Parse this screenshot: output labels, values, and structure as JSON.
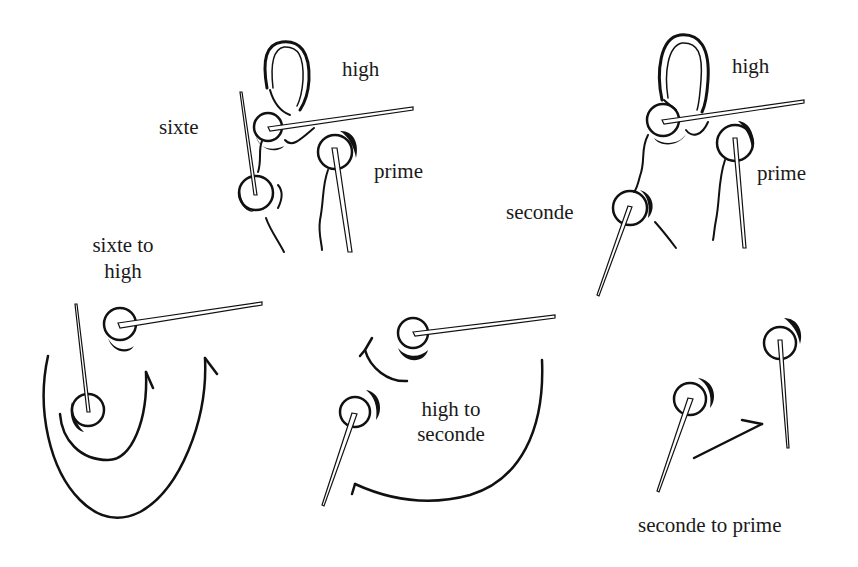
{
  "figure": {
    "colors": {
      "ink": "#111111",
      "background": "#ffffff"
    }
  },
  "panels": {
    "top_left": {
      "labels": {
        "high": "high",
        "sixte": "sixte",
        "prime": "prime"
      }
    },
    "top_right": {
      "labels": {
        "high": "high",
        "seconde": "seconde",
        "prime": "prime"
      }
    },
    "bottom_left": {
      "caption_line1": "sixte to",
      "caption_line2": "high"
    },
    "bottom_middle": {
      "caption_line1": "high to",
      "caption_line2": "seconde"
    },
    "bottom_right": {
      "caption": "seconde to prime"
    }
  }
}
